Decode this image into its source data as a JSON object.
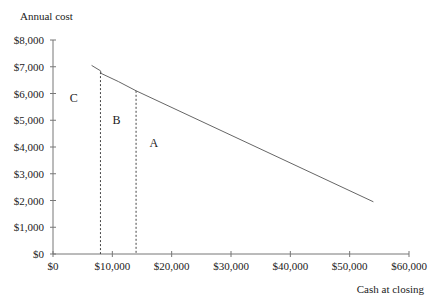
{
  "chart_data": {
    "type": "line",
    "title": "",
    "ylabel": "Annual cost",
    "xlabel": "Cash at closing",
    "xlim": [
      0,
      60000
    ],
    "ylim": [
      0,
      8000
    ],
    "grid": false,
    "x_ticks": [
      "$0",
      "$10,000",
      "$20,000",
      "$30,000",
      "$40,000",
      "$50,000",
      "$60,000"
    ],
    "x_tick_values": [
      0,
      10000,
      20000,
      30000,
      40000,
      50000,
      60000
    ],
    "y_ticks": [
      "$0",
      "$1,000",
      "$2,000",
      "$3,000",
      "$4,000",
      "$5,000",
      "$6,000",
      "$7,000",
      "$8,000"
    ],
    "y_tick_values": [
      0,
      1000,
      2000,
      3000,
      4000,
      5000,
      6000,
      7000,
      8000
    ],
    "series": [
      {
        "name": "Annual cost frontier",
        "x": [
          6500,
          8000,
          8100,
          11000,
          14000,
          54000
        ],
        "y": [
          7050,
          6850,
          6750,
          6450,
          6100,
          1950
        ]
      }
    ],
    "vertical_dashed_lines": [
      {
        "x": 8000,
        "y_top": 6800
      },
      {
        "x": 14000,
        "y_top": 6100
      }
    ],
    "annotations": [
      {
        "text": "C",
        "x": 3500,
        "y": 5700
      },
      {
        "text": "B",
        "x": 10700,
        "y": 4850
      },
      {
        "text": "A",
        "x": 17000,
        "y": 4000
      }
    ]
  }
}
